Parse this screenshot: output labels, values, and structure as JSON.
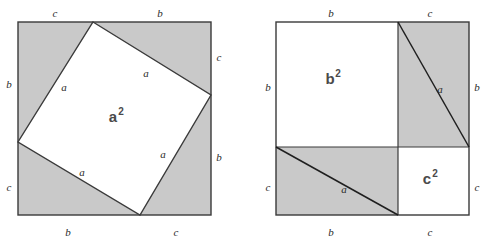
{
  "figure": {
    "colors": {
      "shaded": "#c9c9c9",
      "white": "#ffffff",
      "stroke": "#3a3a3a",
      "label": "#2b2b2b",
      "area_label": "#4a4a4a"
    }
  },
  "left_diagram": {
    "name": "tilted-square-a-squared",
    "outer_square": {
      "x": 18,
      "y": 22,
      "size": 193,
      "fill": "#c9c9c9"
    },
    "inner_square": {
      "fill": "#ffffff",
      "vertices": [
        {
          "x": 93,
          "y": 22
        },
        {
          "x": 211,
          "y": 95
        },
        {
          "x": 140,
          "y": 215
        },
        {
          "x": 18,
          "y": 142
        }
      ]
    },
    "area_label": {
      "text": "a",
      "sup": "2",
      "x": 113,
      "y": 122
    },
    "side_labels": [
      {
        "text": "c",
        "x": 55,
        "y": 14,
        "side": "top-left"
      },
      {
        "text": "b",
        "x": 160,
        "y": 14,
        "side": "top-right"
      },
      {
        "text": "c",
        "x": 219,
        "y": 58,
        "side": "right-top"
      },
      {
        "text": "b",
        "x": 219,
        "y": 158,
        "side": "right-bottom"
      },
      {
        "text": "c",
        "x": 9,
        "y": 188,
        "side": "left-bottom"
      },
      {
        "text": "b",
        "x": 9,
        "y": 85,
        "side": "left-top"
      },
      {
        "text": "b",
        "x": 68,
        "y": 233,
        "side": "bottom-left"
      },
      {
        "text": "c",
        "x": 176,
        "y": 233,
        "side": "bottom-right"
      }
    ],
    "inner_labels": [
      {
        "text": "a",
        "x": 64,
        "y": 88
      },
      {
        "text": "a",
        "x": 146,
        "y": 74
      },
      {
        "text": "a",
        "x": 163,
        "y": 155
      },
      {
        "text": "a",
        "x": 82,
        "y": 173
      }
    ]
  },
  "right_diagram": {
    "name": "split-square-b-squared-c-squared",
    "outer_square": {
      "x": 276,
      "y": 22,
      "size": 193,
      "fill": "#ffffff"
    },
    "split": {
      "vertical_x": 398,
      "horizontal_y": 147
    },
    "regions": [
      {
        "name": "b-squared-region",
        "fill": "#ffffff",
        "x": 276,
        "y": 22,
        "w": 122,
        "h": 125
      },
      {
        "name": "top-right-rect",
        "fill": "#c9c9c9",
        "x": 398,
        "y": 22,
        "w": 71,
        "h": 125
      },
      {
        "name": "bottom-left-rect",
        "fill": "#c9c9c9",
        "x": 276,
        "y": 147,
        "w": 122,
        "h": 68
      },
      {
        "name": "c-squared-region",
        "fill": "#ffffff",
        "x": 398,
        "y": 147,
        "w": 71,
        "h": 68
      }
    ],
    "diagonals": [
      {
        "name": "top-right-diagonal",
        "x1": 398,
        "y1": 22,
        "x2": 469,
        "y2": 147
      },
      {
        "name": "bottom-left-diagonal",
        "x1": 276,
        "y1": 147,
        "x2": 398,
        "y2": 215
      }
    ],
    "area_labels": [
      {
        "text": "b",
        "sup": "2",
        "x": 330,
        "y": 84
      },
      {
        "text": "c",
        "sup": "2",
        "x": 427,
        "y": 184
      }
    ],
    "diagonal_labels": [
      {
        "text": "a",
        "x": 440,
        "y": 90
      },
      {
        "text": "a",
        "x": 344,
        "y": 190
      }
    ],
    "side_labels": [
      {
        "text": "b",
        "x": 331,
        "y": 14,
        "side": "top-left"
      },
      {
        "text": "c",
        "x": 430,
        "y": 14,
        "side": "top-right"
      },
      {
        "text": "b",
        "x": 268,
        "y": 88,
        "side": "left-top"
      },
      {
        "text": "c",
        "x": 268,
        "y": 188,
        "side": "left-bottom"
      },
      {
        "text": "b",
        "x": 477,
        "y": 88,
        "side": "right-top"
      },
      {
        "text": "c",
        "x": 477,
        "y": 188,
        "side": "right-bottom"
      },
      {
        "text": "b",
        "x": 331,
        "y": 233,
        "side": "bottom-left"
      },
      {
        "text": "c",
        "x": 430,
        "y": 233,
        "side": "bottom-right"
      }
    ]
  }
}
